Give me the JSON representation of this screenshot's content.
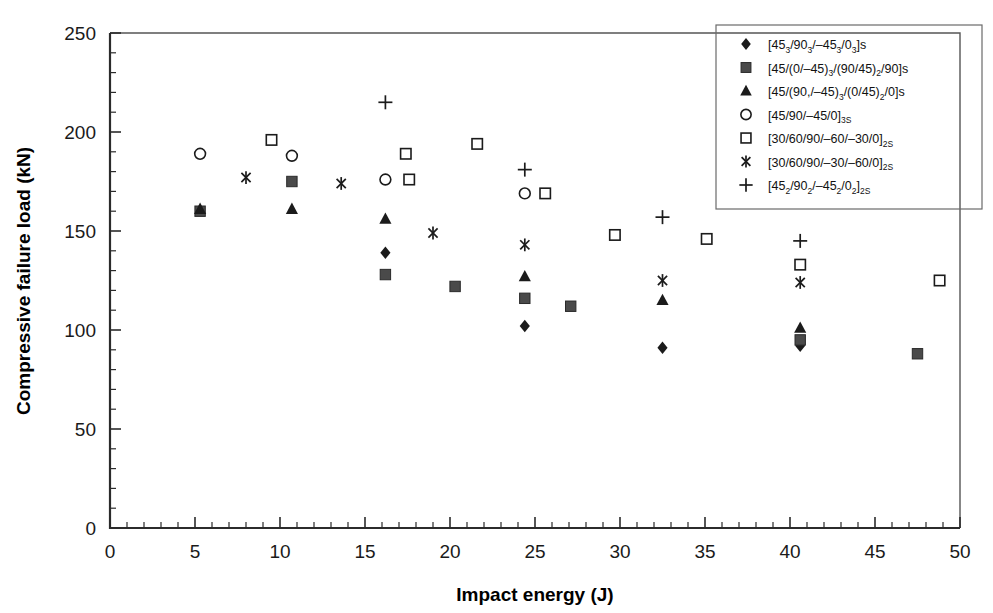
{
  "chart_data": {
    "type": "scatter",
    "title": "",
    "xlabel": "Impact energy (J)",
    "ylabel": "Compressive failure load (kN)",
    "xlim": [
      0,
      50
    ],
    "ylim": [
      0,
      250
    ],
    "xticks": [
      0,
      5,
      10,
      15,
      20,
      25,
      30,
      35,
      40,
      45,
      50
    ],
    "yticks": [
      0,
      50,
      100,
      150,
      200,
      250
    ],
    "x_minor_step": 1,
    "y_minor_step": 10,
    "grid": false,
    "legend_position": "top-right",
    "series": [
      {
        "name": "[45_3/90_3/-45_3/0_3]s",
        "label_parts": [
          {
            "t": "[45",
            "sub": false
          },
          {
            "t": "3",
            "sub": true
          },
          {
            "t": "/90",
            "sub": false
          },
          {
            "t": "3",
            "sub": true
          },
          {
            "t": "/–45",
            "sub": false
          },
          {
            "t": "3",
            "sub": true
          },
          {
            "t": "/0",
            "sub": false
          },
          {
            "t": "3",
            "sub": true
          },
          {
            "t": "]s",
            "sub": false
          }
        ],
        "marker": "filled-diamond",
        "color": "#1b1b1b",
        "points": [
          {
            "x": 16.2,
            "y": 139
          },
          {
            "x": 24.4,
            "y": 102
          },
          {
            "x": 32.5,
            "y": 91
          },
          {
            "x": 40.6,
            "y": 92
          }
        ]
      },
      {
        "name": "[45/(0/-45)_3/(90/45)_2/90]s",
        "label_parts": [
          {
            "t": "[45/(0/–45)",
            "sub": false
          },
          {
            "t": "3",
            "sub": true
          },
          {
            "t": "/(90/45)",
            "sub": false
          },
          {
            "t": "2",
            "sub": true
          },
          {
            "t": "/90]s",
            "sub": false
          }
        ],
        "marker": "filled-square",
        "color": "#4a4a4a",
        "points": [
          {
            "x": 5.3,
            "y": 160
          },
          {
            "x": 10.7,
            "y": 175
          },
          {
            "x": 16.2,
            "y": 128
          },
          {
            "x": 20.3,
            "y": 122
          },
          {
            "x": 24.4,
            "y": 116
          },
          {
            "x": 27.1,
            "y": 112
          },
          {
            "x": 40.6,
            "y": 95
          },
          {
            "x": 47.5,
            "y": 88
          }
        ]
      },
      {
        "name": "[45/(90,/-45)_3/(0/45)_2/0]s",
        "label_parts": [
          {
            "t": "[45/(90,/–45)",
            "sub": false
          },
          {
            "t": "3",
            "sub": true
          },
          {
            "t": "/(0/45)",
            "sub": false
          },
          {
            "t": "2",
            "sub": true
          },
          {
            "t": "/0]s",
            "sub": false
          }
        ],
        "marker": "filled-triangle",
        "color": "#1b1b1b",
        "points": [
          {
            "x": 5.3,
            "y": 161
          },
          {
            "x": 10.7,
            "y": 161
          },
          {
            "x": 16.2,
            "y": 156
          },
          {
            "x": 24.4,
            "y": 127
          },
          {
            "x": 32.5,
            "y": 115
          },
          {
            "x": 40.6,
            "y": 101
          }
        ]
      },
      {
        "name": "[45/90/-45/0]_3s",
        "label_parts": [
          {
            "t": "[45/90/–45/0]",
            "sub": false
          },
          {
            "t": "3S",
            "sub": true
          }
        ],
        "marker": "open-circle",
        "color": "#1b1b1b",
        "points": [
          {
            "x": 5.3,
            "y": 189
          },
          {
            "x": 10.7,
            "y": 188
          },
          {
            "x": 16.2,
            "y": 176
          },
          {
            "x": 24.4,
            "y": 169
          }
        ]
      },
      {
        "name": "[30/60/90/-60/-30/0]_2s",
        "label_parts": [
          {
            "t": "[30/60/90/–60/–30/0]",
            "sub": false
          },
          {
            "t": "2S",
            "sub": true
          }
        ],
        "marker": "open-square",
        "color": "#1b1b1b",
        "points": [
          {
            "x": 9.5,
            "y": 196
          },
          {
            "x": 17.4,
            "y": 189
          },
          {
            "x": 17.6,
            "y": 176
          },
          {
            "x": 21.6,
            "y": 194
          },
          {
            "x": 25.6,
            "y": 169
          },
          {
            "x": 29.7,
            "y": 148
          },
          {
            "x": 35.1,
            "y": 146
          },
          {
            "x": 40.6,
            "y": 133
          },
          {
            "x": 48.8,
            "y": 125
          }
        ]
      },
      {
        "name": "[30/60/90/-30/-60/0]_2s",
        "label_parts": [
          {
            "t": "[30/60/90/–30/–60/0]",
            "sub": false
          },
          {
            "t": "2S",
            "sub": true
          }
        ],
        "marker": "asterisk",
        "color": "#1b1b1b",
        "points": [
          {
            "x": 8.0,
            "y": 177
          },
          {
            "x": 13.6,
            "y": 174
          },
          {
            "x": 19.0,
            "y": 149
          },
          {
            "x": 24.4,
            "y": 143
          },
          {
            "x": 32.5,
            "y": 125
          },
          {
            "x": 40.6,
            "y": 124
          }
        ]
      },
      {
        "name": "[45_2/90_2/-45_2/0_2]_2s",
        "label_parts": [
          {
            "t": "[45",
            "sub": false
          },
          {
            "t": "2",
            "sub": true
          },
          {
            "t": "/90",
            "sub": false
          },
          {
            "t": "2",
            "sub": true
          },
          {
            "t": "/–45",
            "sub": false
          },
          {
            "t": "2",
            "sub": true
          },
          {
            "t": "/0",
            "sub": false
          },
          {
            "t": "2",
            "sub": true
          },
          {
            "t": "]",
            "sub": false
          },
          {
            "t": "2S",
            "sub": true
          }
        ],
        "marker": "plus",
        "color": "#1b1b1b",
        "points": [
          {
            "x": 16.2,
            "y": 215
          },
          {
            "x": 24.4,
            "y": 181
          },
          {
            "x": 32.5,
            "y": 157
          },
          {
            "x": 40.6,
            "y": 145
          }
        ]
      }
    ]
  },
  "axes": {
    "x_label": "Impact energy (J)",
    "y_label": "Compressive failure load (kN)",
    "x_tick_labels": [
      "0",
      "5",
      "10",
      "15",
      "20",
      "25",
      "30",
      "35",
      "40",
      "45",
      "50"
    ],
    "y_tick_labels": [
      "0",
      "50",
      "100",
      "150",
      "200",
      "250"
    ]
  },
  "colors": {
    "marker_black": "#1b1b1b",
    "marker_gray": "#4a4a4a",
    "frame": "#555555",
    "axis": "#2b2b2b",
    "background": "#ffffff"
  }
}
